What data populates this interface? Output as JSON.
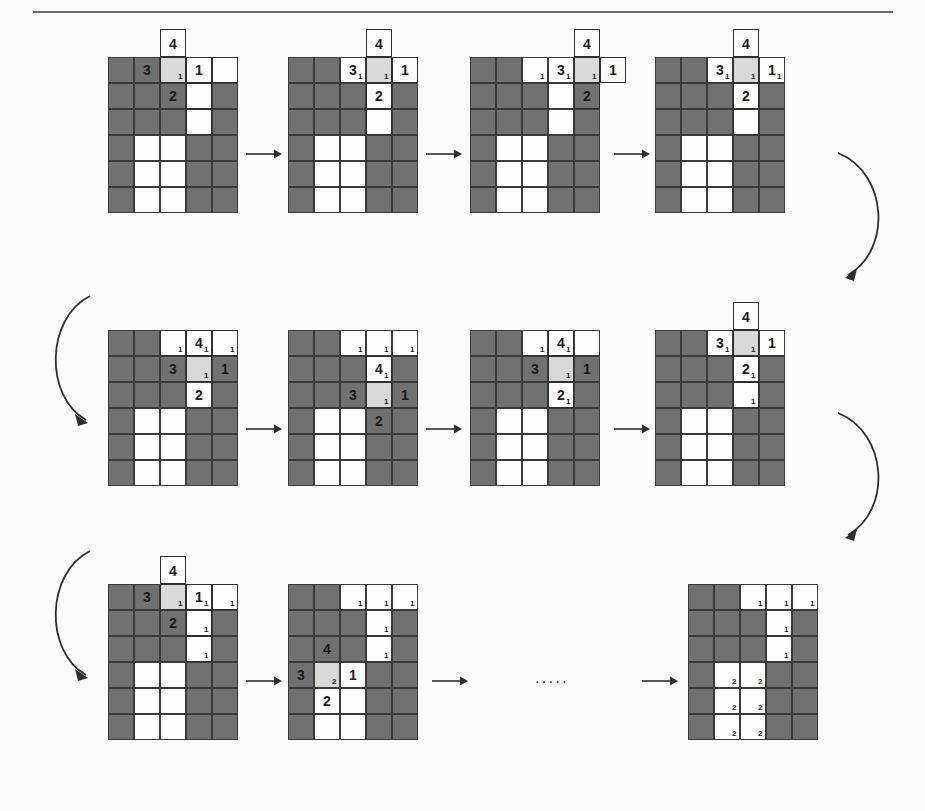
{
  "figure": {
    "type": "diagram",
    "ellipsis": ".....",
    "colors": {
      "wall": "#717171",
      "free": "#fdfdfd",
      "highlight": "#d8d8d8",
      "grid_line": "#3a3a3a",
      "outline": "#2e2e2e",
      "arrow": "#2e2e2e"
    },
    "legend": {
      "wall_label": "occupied cell",
      "free_label": "free cell",
      "highlight_label": "current cell"
    }
  },
  "grid_spec": {
    "cols": 5,
    "rows": 6,
    "cell_size": 26
  },
  "steps": [
    {
      "id": "step-1",
      "row": 1,
      "index": 1,
      "walls": [
        [
          1,
          1,
          0,
          0,
          0
        ],
        [
          1,
          1,
          1,
          0,
          1
        ],
        [
          1,
          1,
          1,
          0,
          1
        ],
        [
          1,
          0,
          0,
          1,
          1
        ],
        [
          1,
          0,
          0,
          1,
          1
        ],
        [
          1,
          0,
          0,
          1,
          1
        ]
      ],
      "highlights": [
        [
          0,
          2
        ]
      ],
      "big_labels": [
        {
          "r": 0,
          "c": 1,
          "text": "3"
        },
        {
          "r": 0,
          "c": 3,
          "text": "1"
        },
        {
          "r": 1,
          "c": 2,
          "text": "2"
        }
      ],
      "small_labels": [
        {
          "r": 0,
          "c": 2,
          "text": "1"
        }
      ],
      "popout": {
        "c": 2,
        "text": "4"
      },
      "outline_cells": [
        [
          0,
          2
        ],
        [
          0,
          3
        ],
        [
          0,
          4
        ],
        [
          1,
          3
        ],
        [
          2,
          3
        ]
      ]
    },
    {
      "id": "step-2",
      "row": 1,
      "index": 2,
      "walls": [
        [
          1,
          1,
          0,
          0,
          0
        ],
        [
          1,
          1,
          1,
          0,
          1
        ],
        [
          1,
          1,
          1,
          0,
          1
        ],
        [
          1,
          0,
          0,
          1,
          1
        ],
        [
          1,
          0,
          0,
          1,
          1
        ],
        [
          1,
          0,
          0,
          1,
          1
        ]
      ],
      "highlights": [
        [
          0,
          3
        ]
      ],
      "big_labels": [
        {
          "r": 0,
          "c": 2,
          "text": "3"
        },
        {
          "r": 0,
          "c": 4,
          "text": "1"
        },
        {
          "r": 1,
          "c": 3,
          "text": "2"
        }
      ],
      "small_labels": [
        {
          "r": 0,
          "c": 2,
          "text": "1"
        },
        {
          "r": 0,
          "c": 3,
          "text": "1"
        }
      ],
      "popout": {
        "c": 3,
        "text": "4"
      },
      "outline_cells": [
        [
          0,
          3
        ],
        [
          0,
          4
        ],
        [
          1,
          3
        ],
        [
          2,
          3
        ]
      ]
    },
    {
      "id": "step-3",
      "row": 1,
      "index": 3,
      "walls": [
        [
          1,
          1,
          0,
          0,
          0
        ],
        [
          1,
          1,
          1,
          0,
          1
        ],
        [
          1,
          1,
          1,
          0,
          1
        ],
        [
          1,
          0,
          0,
          1,
          1
        ],
        [
          1,
          0,
          0,
          1,
          1
        ],
        [
          1,
          0,
          0,
          1,
          1
        ]
      ],
      "highlights": [
        [
          0,
          4
        ]
      ],
      "big_labels": [
        {
          "r": 0,
          "c": 3,
          "text": "3"
        },
        {
          "r": 0,
          "c": 5,
          "text": "1"
        },
        {
          "r": 1,
          "c": 4,
          "text": "2"
        }
      ],
      "small_labels": [
        {
          "r": 0,
          "c": 2,
          "text": "1"
        },
        {
          "r": 0,
          "c": 3,
          "text": "1"
        },
        {
          "r": 0,
          "c": 4,
          "text": "1"
        }
      ],
      "popout": {
        "c": 4,
        "text": "4"
      },
      "outline_cells": [
        [
          0,
          4
        ],
        [
          0,
          5
        ],
        [
          1,
          4
        ]
      ]
    },
    {
      "id": "step-4",
      "row": 1,
      "index": 4,
      "walls": [
        [
          1,
          1,
          0,
          0,
          0
        ],
        [
          1,
          1,
          1,
          0,
          1
        ],
        [
          1,
          1,
          1,
          0,
          1
        ],
        [
          1,
          0,
          0,
          1,
          1
        ],
        [
          1,
          0,
          0,
          1,
          1
        ],
        [
          1,
          0,
          0,
          1,
          1
        ]
      ],
      "highlights": [
        [
          0,
          3
        ]
      ],
      "big_labels": [
        {
          "r": 0,
          "c": 2,
          "text": "3"
        },
        {
          "r": 0,
          "c": 4,
          "text": "1"
        },
        {
          "r": 1,
          "c": 3,
          "text": "2"
        }
      ],
      "small_labels": [
        {
          "r": 0,
          "c": 2,
          "text": "1"
        },
        {
          "r": 0,
          "c": 3,
          "text": "1"
        },
        {
          "r": 0,
          "c": 4,
          "text": "1"
        }
      ],
      "popout": {
        "c": 3,
        "text": "4"
      },
      "outline_cells": [
        [
          0,
          3
        ],
        [
          1,
          3
        ],
        [
          2,
          3
        ]
      ]
    },
    {
      "id": "step-5",
      "row": 2,
      "index": 1,
      "walls": [
        [
          1,
          1,
          0,
          0,
          0
        ],
        [
          1,
          1,
          1,
          0,
          1
        ],
        [
          1,
          1,
          1,
          0,
          1
        ],
        [
          1,
          0,
          0,
          1,
          1
        ],
        [
          1,
          0,
          0,
          1,
          1
        ],
        [
          1,
          0,
          0,
          1,
          1
        ]
      ],
      "highlights": [
        [
          1,
          3
        ]
      ],
      "big_labels": [
        {
          "r": 0,
          "c": 3,
          "text": "4"
        },
        {
          "r": 1,
          "c": 2,
          "text": "3"
        },
        {
          "r": 1,
          "c": 4,
          "text": "1"
        },
        {
          "r": 2,
          "c": 3,
          "text": "2"
        }
      ],
      "small_labels": [
        {
          "r": 0,
          "c": 2,
          "text": "1"
        },
        {
          "r": 0,
          "c": 3,
          "text": "1"
        },
        {
          "r": 0,
          "c": 4,
          "text": "1"
        },
        {
          "r": 1,
          "c": 3,
          "text": "1"
        }
      ],
      "popout": null,
      "outline_cells": [
        [
          0,
          2
        ],
        [
          0,
          3
        ],
        [
          0,
          4
        ],
        [
          1,
          3
        ]
      ]
    },
    {
      "id": "step-6",
      "row": 2,
      "index": 2,
      "walls": [
        [
          1,
          1,
          0,
          0,
          0
        ],
        [
          1,
          1,
          1,
          0,
          1
        ],
        [
          1,
          1,
          1,
          0,
          1
        ],
        [
          1,
          0,
          0,
          1,
          1
        ],
        [
          1,
          0,
          0,
          1,
          1
        ],
        [
          1,
          0,
          0,
          1,
          1
        ]
      ],
      "highlights": [
        [
          2,
          3
        ]
      ],
      "big_labels": [
        {
          "r": 1,
          "c": 3,
          "text": "4"
        },
        {
          "r": 2,
          "c": 2,
          "text": "3"
        },
        {
          "r": 2,
          "c": 4,
          "text": "1"
        },
        {
          "r": 3,
          "c": 3,
          "text": "2"
        }
      ],
      "small_labels": [
        {
          "r": 0,
          "c": 2,
          "text": "1"
        },
        {
          "r": 0,
          "c": 3,
          "text": "1"
        },
        {
          "r": 0,
          "c": 4,
          "text": "1"
        },
        {
          "r": 1,
          "c": 3,
          "text": "1"
        },
        {
          "r": 2,
          "c": 3,
          "text": "1"
        }
      ],
      "popout": null,
      "outline_cells": [
        [
          1,
          3
        ],
        [
          2,
          3
        ]
      ]
    },
    {
      "id": "step-7",
      "row": 2,
      "index": 3,
      "walls": [
        [
          1,
          1,
          0,
          0,
          0
        ],
        [
          1,
          1,
          1,
          0,
          1
        ],
        [
          1,
          1,
          1,
          0,
          1
        ],
        [
          1,
          0,
          0,
          1,
          1
        ],
        [
          1,
          0,
          0,
          1,
          1
        ],
        [
          1,
          0,
          0,
          1,
          1
        ]
      ],
      "highlights": [
        [
          1,
          3
        ]
      ],
      "big_labels": [
        {
          "r": 0,
          "c": 3,
          "text": "4"
        },
        {
          "r": 1,
          "c": 2,
          "text": "3"
        },
        {
          "r": 1,
          "c": 4,
          "text": "1"
        },
        {
          "r": 2,
          "c": 3,
          "text": "2"
        }
      ],
      "small_labels": [
        {
          "r": 0,
          "c": 2,
          "text": "1"
        },
        {
          "r": 0,
          "c": 3,
          "text": "1"
        },
        {
          "r": 1,
          "c": 3,
          "text": "1"
        },
        {
          "r": 2,
          "c": 3,
          "text": "1"
        }
      ],
      "popout": null,
      "outline_cells": [
        [
          0,
          3
        ],
        [
          1,
          3
        ],
        [
          2,
          3
        ]
      ]
    },
    {
      "id": "step-8",
      "row": 2,
      "index": 4,
      "walls": [
        [
          1,
          1,
          0,
          0,
          0
        ],
        [
          1,
          1,
          1,
          0,
          1
        ],
        [
          1,
          1,
          1,
          0,
          1
        ],
        [
          1,
          0,
          0,
          1,
          1
        ],
        [
          1,
          0,
          0,
          1,
          1
        ],
        [
          1,
          0,
          0,
          1,
          1
        ]
      ],
      "highlights": [
        [
          0,
          3
        ]
      ],
      "big_labels": [
        {
          "r": 0,
          "c": 2,
          "text": "3"
        },
        {
          "r": 0,
          "c": 4,
          "text": "1"
        },
        {
          "r": 1,
          "c": 3,
          "text": "2"
        }
      ],
      "small_labels": [
        {
          "r": 0,
          "c": 2,
          "text": "1"
        },
        {
          "r": 0,
          "c": 3,
          "text": "1"
        },
        {
          "r": 1,
          "c": 3,
          "text": "1"
        },
        {
          "r": 2,
          "c": 3,
          "text": "1"
        }
      ],
      "popout": {
        "c": 3,
        "text": "4"
      },
      "outline_cells": [
        [
          0,
          3
        ],
        [
          1,
          3
        ],
        [
          2,
          3
        ]
      ]
    },
    {
      "id": "step-9",
      "row": 3,
      "index": 1,
      "walls": [
        [
          1,
          1,
          0,
          0,
          0
        ],
        [
          1,
          1,
          1,
          0,
          1
        ],
        [
          1,
          1,
          1,
          0,
          1
        ],
        [
          1,
          0,
          0,
          1,
          1
        ],
        [
          1,
          0,
          0,
          1,
          1
        ],
        [
          1,
          0,
          0,
          1,
          1
        ]
      ],
      "highlights": [
        [
          0,
          2
        ]
      ],
      "big_labels": [
        {
          "r": 0,
          "c": 1,
          "text": "3"
        },
        {
          "r": 0,
          "c": 3,
          "text": "1"
        },
        {
          "r": 1,
          "c": 2,
          "text": "2"
        }
      ],
      "small_labels": [
        {
          "r": 0,
          "c": 2,
          "text": "1"
        },
        {
          "r": 0,
          "c": 3,
          "text": "1"
        },
        {
          "r": 0,
          "c": 4,
          "text": "1"
        },
        {
          "r": 1,
          "c": 3,
          "text": "1"
        },
        {
          "r": 2,
          "c": 3,
          "text": "1"
        }
      ],
      "popout": {
        "c": 2,
        "text": "4"
      },
      "outline_cells": [
        [
          0,
          2
        ],
        [
          0,
          3
        ],
        [
          0,
          4
        ],
        [
          1,
          3
        ],
        [
          2,
          3
        ]
      ]
    },
    {
      "id": "step-10",
      "row": 3,
      "index": 2,
      "walls": [
        [
          1,
          1,
          0,
          0,
          0
        ],
        [
          1,
          1,
          1,
          0,
          1
        ],
        [
          1,
          1,
          1,
          0,
          1
        ],
        [
          1,
          0,
          0,
          1,
          1
        ],
        [
          1,
          0,
          0,
          1,
          1
        ],
        [
          1,
          0,
          0,
          1,
          1
        ]
      ],
      "highlights": [
        [
          3,
          1
        ]
      ],
      "big_labels": [
        {
          "r": 2,
          "c": 1,
          "text": "4"
        },
        {
          "r": 3,
          "c": 0,
          "text": "3"
        },
        {
          "r": 3,
          "c": 2,
          "text": "1"
        },
        {
          "r": 4,
          "c": 1,
          "text": "2"
        }
      ],
      "small_labels": [
        {
          "r": 0,
          "c": 2,
          "text": "1"
        },
        {
          "r": 0,
          "c": 3,
          "text": "1"
        },
        {
          "r": 0,
          "c": 4,
          "text": "1"
        },
        {
          "r": 1,
          "c": 3,
          "text": "1"
        },
        {
          "r": 2,
          "c": 3,
          "text": "1"
        },
        {
          "r": 3,
          "c": 1,
          "text": "2"
        }
      ],
      "popout": null,
      "outline_cells": []
    },
    {
      "id": "step-11",
      "row": 3,
      "index": 3,
      "walls": [
        [
          1,
          1,
          0,
          0,
          0
        ],
        [
          1,
          1,
          1,
          0,
          1
        ],
        [
          1,
          1,
          1,
          0,
          1
        ],
        [
          1,
          0,
          0,
          1,
          1
        ],
        [
          1,
          0,
          0,
          1,
          1
        ],
        [
          1,
          0,
          0,
          1,
          1
        ]
      ],
      "highlights": [],
      "big_labels": [],
      "small_labels": [
        {
          "r": 0,
          "c": 2,
          "text": "1"
        },
        {
          "r": 0,
          "c": 3,
          "text": "1"
        },
        {
          "r": 0,
          "c": 4,
          "text": "1"
        },
        {
          "r": 1,
          "c": 3,
          "text": "1"
        },
        {
          "r": 2,
          "c": 3,
          "text": "1"
        },
        {
          "r": 3,
          "c": 1,
          "text": "2"
        },
        {
          "r": 3,
          "c": 2,
          "text": "2"
        },
        {
          "r": 4,
          "c": 1,
          "text": "2"
        },
        {
          "r": 4,
          "c": 2,
          "text": "2"
        },
        {
          "r": 5,
          "c": 1,
          "text": "2"
        },
        {
          "r": 5,
          "c": 2,
          "text": "2"
        }
      ],
      "popout": null,
      "outline_cells": []
    }
  ],
  "arrows": {
    "straight_label": "arrow-right",
    "curved_label": "arrow-wrap",
    "ellipsis_label": "continues"
  }
}
